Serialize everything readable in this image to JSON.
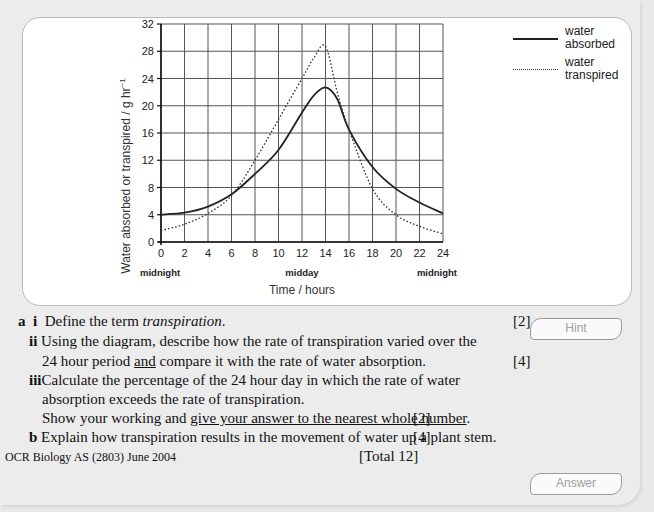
{
  "chart_data": {
    "type": "line",
    "title": "",
    "xlabel": "Time / hours",
    "ylabel": "Water absorbed or transpired / g hr⁻¹",
    "xlim": [
      0,
      24
    ],
    "ylim": [
      0,
      32
    ],
    "x_ticks": [
      0,
      2,
      4,
      6,
      8,
      10,
      12,
      14,
      16,
      18,
      20,
      22,
      24
    ],
    "y_ticks": [
      0,
      4,
      8,
      12,
      16,
      20,
      24,
      28,
      32
    ],
    "x_annotations": [
      {
        "x": 0,
        "label": "midnight"
      },
      {
        "x": 12,
        "label": "midday"
      },
      {
        "x": 24,
        "label": "midnight"
      }
    ],
    "grid": true,
    "legend_position": "right",
    "x": [
      0,
      2,
      4,
      6,
      8,
      10,
      12,
      13,
      14,
      15,
      16,
      18,
      20,
      22,
      24
    ],
    "series": [
      {
        "name": "water absorbed",
        "style": "solid",
        "values": [
          4,
          4.3,
          5.2,
          7,
          10,
          13.5,
          19,
          21.5,
          22.7,
          21,
          16.5,
          11,
          7.8,
          5.8,
          4.2
        ]
      },
      {
        "name": "water transpired",
        "style": "dotted",
        "values": [
          1.7,
          2.6,
          4.2,
          6.8,
          12,
          18,
          24,
          27,
          28.7,
          22,
          16.5,
          7.8,
          4,
          2.3,
          1.2
        ]
      }
    ]
  },
  "legend": {
    "items": [
      {
        "line1": "water",
        "line2": "absorbed"
      },
      {
        "line1": "water",
        "line2": "transpired"
      }
    ]
  },
  "axis": {
    "ylabel": "Water absorbed or transpired / g hr",
    "ylabel_sup": "−1",
    "xlabel": "Time / hours",
    "y_ticks": [
      "0",
      "4",
      "8",
      "12",
      "16",
      "20",
      "24",
      "28",
      "32"
    ],
    "x_ticks": [
      "0",
      "2",
      "4",
      "6",
      "8",
      "10",
      "12",
      "14",
      "16",
      "18",
      "20",
      "22",
      "24"
    ],
    "x_annotations": [
      "midnight",
      "midday",
      "midnight"
    ]
  },
  "question": {
    "a_label": "a",
    "ai_label": "i",
    "ai_text_pre": "Define the term ",
    "ai_text_italic": "transpiration",
    "ai_text_post": ".",
    "ai_marks": "[2]",
    "aii_label": "ii",
    "aii_line1": "Using the diagram, describe how the rate of transpiration varied over the",
    "aii_line2_pre": "24 hour period ",
    "aii_line2_underline": "and",
    "aii_line2_post": " compare it with the rate of water absorption.",
    "aii_marks": "[4]",
    "aiii_label": "iii",
    "aiii_line1": "Calculate the percentage of the 24 hour day in which the rate of water",
    "aiii_line2": "absorption exceeds the rate of transpiration.",
    "aiii_line3_pre": "Show your working and ",
    "aiii_line3_underline": "give your answer to the nearest whole number",
    "aiii_line3_post": ".",
    "aiii_marks": "[2]",
    "b_label": "b",
    "b_text": "Explain how transpiration results in the movement of water up a plant stem.",
    "b_marks": "[4]",
    "source": "OCR Biology AS (2803) June 2004",
    "total": "[Total 12]"
  },
  "buttons": {
    "hint": "Hint",
    "answer": "Answer"
  }
}
